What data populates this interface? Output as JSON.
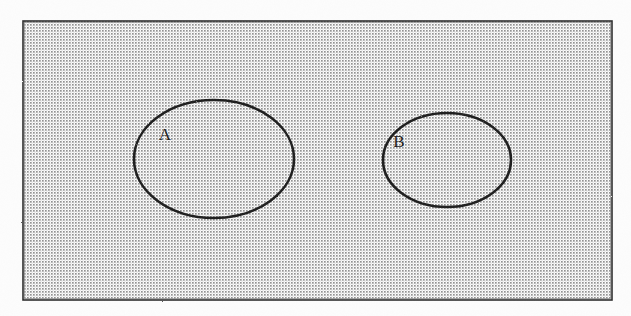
{
  "figure": {
    "kind": "venn-diagram",
    "caption": "",
    "background_color": "#fdfdfd",
    "ink_color": "#1c1c1c"
  },
  "universal_set": {
    "shape": "rectangle",
    "label": "",
    "fill_pattern": "dot-stipple",
    "pattern_dot_color": "#4d4d4d",
    "pattern_pitch_px": 3,
    "border_color": "#2a2a2a",
    "x": 23,
    "y": 21,
    "width": 589,
    "height": 279
  },
  "sets": [
    {
      "name": "set-a",
      "label": "A",
      "shape": "ellipse",
      "cx": 214,
      "cy": 159,
      "rx": 80,
      "ry": 59,
      "stroke_color": "#1c1c1c",
      "stroke_width": 2.6,
      "label_x": 165,
      "label_y": 140
    },
    {
      "name": "set-b",
      "label": "B",
      "shape": "ellipse",
      "cx": 447,
      "cy": 160,
      "rx": 64,
      "ry": 47,
      "stroke_color": "#1c1c1c",
      "stroke_width": 2.6,
      "label_x": 399,
      "label_y": 147
    }
  ],
  "relationship": {
    "type": "disjoint",
    "description": "A and B do not overlap"
  }
}
